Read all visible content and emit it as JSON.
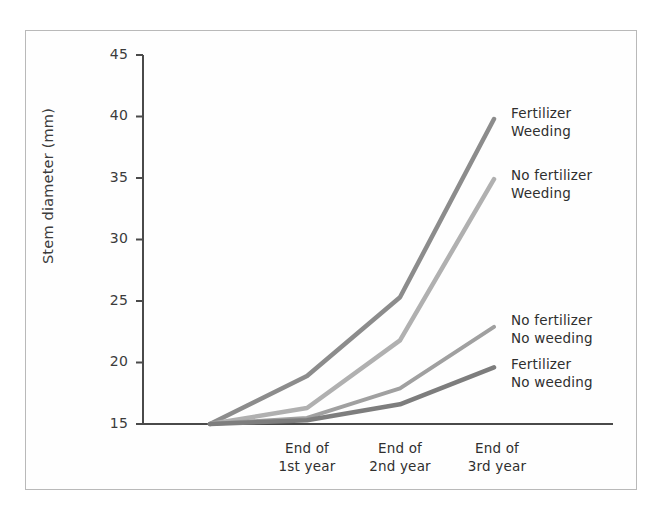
{
  "chart_data": {
    "type": "line",
    "title": "",
    "xlabel": "",
    "ylabel": "Stem diameter (mm)",
    "categories": [
      "Start",
      "End of\n1st year",
      "End of\n2nd year",
      "End of\n3rd year"
    ],
    "x_tick_labels": [
      {
        "line1": "End of",
        "line2": "1st year"
      },
      {
        "line1": "End of",
        "line2": "2nd year"
      },
      {
        "line1": "End of",
        "line2": "3rd year"
      }
    ],
    "y_tick_labels": [
      "45",
      "40",
      "35",
      "30",
      "25",
      "20",
      "15"
    ],
    "y_ticks": [
      45,
      40,
      35,
      30,
      25,
      20,
      15
    ],
    "ylim": [
      15,
      45
    ],
    "grid": false,
    "legend_position": "inline-right-end-labels",
    "series": [
      {
        "name": "Fertilizer Weeding",
        "label_line1": "Fertilizer",
        "label_line2": "Weeding",
        "color": "#8c8c8c",
        "values": [
          15.0,
          18.9,
          25.3,
          39.8
        ]
      },
      {
        "name": "No fertilizer Weeding",
        "label_line1": "No fertilizer",
        "label_line2": "Weeding",
        "color": "#b0b0b0",
        "values": [
          15.0,
          16.3,
          21.8,
          34.9
        ]
      },
      {
        "name": "No fertilizer No weeding",
        "label_line1": "No fertilizer",
        "label_line2": "No weeding",
        "color": "#a0a0a0",
        "values": [
          15.0,
          15.5,
          17.9,
          22.9
        ]
      },
      {
        "name": "Fertilizer No weeding",
        "label_line1": "Fertilizer",
        "label_line2": "No weeding",
        "color": "#7d7d7d",
        "values": [
          15.0,
          15.3,
          16.6,
          19.6
        ]
      }
    ]
  },
  "axis": {
    "y_label": "Stem diameter (mm)"
  }
}
